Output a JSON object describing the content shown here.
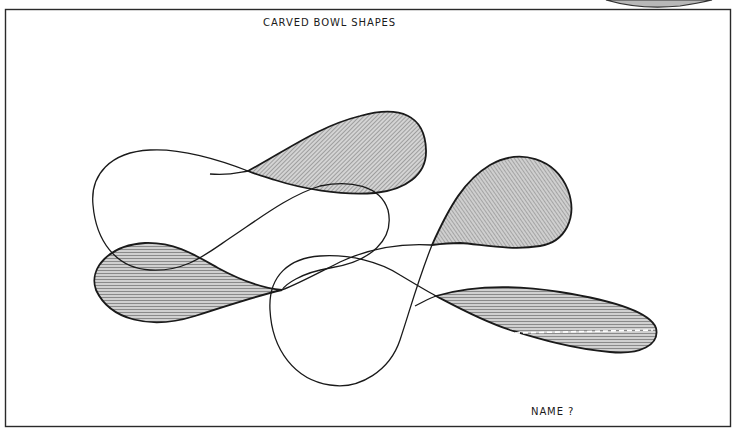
{
  "sheet": {
    "title": "CARVED BOWL SHAPES",
    "footer_label": "NAME ?"
  },
  "colors": {
    "ink": "#1a1a1a",
    "hatch_fill": "#bdbdbd",
    "paper": "#ffffff",
    "frame": "#2a2a2a"
  },
  "diagram": {
    "shapes": [
      {
        "name": "upper-center-lobe",
        "hatched": true,
        "hatch": "diagonal"
      },
      {
        "name": "left-lower-lobe",
        "hatched": true,
        "hatch": "horizontal"
      },
      {
        "name": "right-upper-lobe",
        "hatched": true,
        "hatch": "diagonal"
      },
      {
        "name": "right-lower-lobe",
        "hatched": true,
        "hatch": "horizontal",
        "centerline": "dashed"
      },
      {
        "name": "left-open-loop",
        "hatched": false
      },
      {
        "name": "center-open-loop",
        "hatched": false
      },
      {
        "name": "bottom-open-loop",
        "hatched": false
      }
    ]
  }
}
